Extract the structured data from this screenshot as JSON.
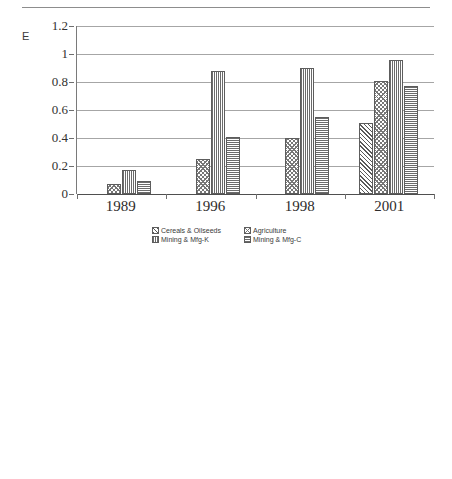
{
  "page": {
    "top_rule": true
  },
  "charts": [
    {
      "panel_label": "E",
      "legend_items": [
        {
          "label": "Cereals & Oilseeds",
          "pattern": "pat-diag"
        },
        {
          "label": "Agriculture",
          "pattern": "pat-check"
        },
        {
          "label": "Mining & Mfg-K",
          "pattern": "pat-vert"
        },
        {
          "label": "Mining & Mfg-C",
          "pattern": "pat-horz"
        }
      ]
    },
    {
      "panel_label": "F",
      "legend_items": [
        {
          "label": "Basic",
          "pattern": "pat-diag"
        },
        {
          "label": "Capital",
          "pattern": "pat-horz"
        },
        {
          "label": "Consumer Durables",
          "pattern": "pat-check"
        },
        {
          "label": "Consumer Non Durables",
          "pattern": "pat-vert"
        }
      ]
    }
  ],
  "chart_data": [
    {
      "type": "bar",
      "id": "chart-e",
      "title": "E",
      "xlabel": "",
      "ylabel": "",
      "ylim": [
        0,
        1.2
      ],
      "yticks": [
        0,
        0.2,
        0.4,
        0.6,
        0.8,
        1,
        1.2
      ],
      "ytick_labels": [
        "0",
        "0.2",
        "0.4",
        "0.6",
        "0.8",
        "1",
        "1.2"
      ],
      "grid": true,
      "legend_position": "bottom",
      "categories": [
        "1989",
        "1996",
        "1998",
        "2001"
      ],
      "series": [
        {
          "name": "Cereals & Oilseeds",
          "pattern": "pat-diag",
          "values": [
            0,
            0,
            0,
            0.51
          ]
        },
        {
          "name": "Agriculture",
          "pattern": "pat-check",
          "values": [
            0.07,
            0.25,
            0.4,
            0.81
          ]
        },
        {
          "name": "Mining & Mfg-K",
          "pattern": "pat-vert",
          "values": [
            0.17,
            0.88,
            0.9,
            0.96
          ]
        },
        {
          "name": "Mining & Mfg-C",
          "pattern": "pat-horz",
          "values": [
            0.09,
            0.41,
            0.55,
            0.77
          ]
        }
      ]
    },
    {
      "type": "bar",
      "id": "chart-f",
      "title": "F",
      "xlabel": "",
      "ylabel": "",
      "ylim": [
        0,
        1.2
      ],
      "yticks": [
        0,
        0.2,
        0.4,
        0.6,
        0.8,
        1,
        1.2
      ],
      "ytick_labels": [
        "0",
        "0.2",
        "0.4",
        "0.6",
        "0.8",
        "1",
        "1.2"
      ],
      "grid": true,
      "legend_position": "bottom",
      "categories": [
        "1989",
        "1996",
        "1998",
        "2001"
      ],
      "series": [
        {
          "name": "Basic",
          "pattern": "pat-diag",
          "values": [
            0.13,
            0.935,
            0.95,
            0.97
          ]
        },
        {
          "name": "Capital",
          "pattern": "pat-horz",
          "values": [
            0.22,
            0.81,
            0.85,
            0.965
          ]
        },
        {
          "name": "Consumer Durables",
          "pattern": "pat-check",
          "values": [
            0.155,
            0.445,
            0.6,
            0.825
          ]
        },
        {
          "name": "Consumer Non Durables",
          "pattern": "pat-vert",
          "values": [
            0.05,
            0.34,
            0.475,
            0.74
          ]
        },
        {
          "name": "Basic-alt",
          "pattern": "pat-diag2",
          "values": [
            0.185,
            0.63,
            0.745,
            0.905
          ]
        }
      ]
    }
  ]
}
